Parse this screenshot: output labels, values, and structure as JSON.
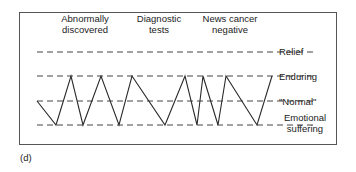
{
  "diagram": {
    "panel_label": "(d)",
    "events": [
      {
        "label_line1": "Abnormally",
        "label_line2": "discovered"
      },
      {
        "label_line1": "Diagnostic",
        "label_line2": "tests"
      },
      {
        "label_line1": "News cancer",
        "label_line2": "negative"
      }
    ],
    "levels": [
      {
        "name": "relief",
        "label": "Relief",
        "y": 52
      },
      {
        "name": "enduring",
        "label": "Enduring",
        "y": 76
      },
      {
        "name": "normal",
        "label": "\"Normal\"",
        "y": 101
      },
      {
        "name": "emotional-suffering",
        "label_line1": "Emotional",
        "label_line2": "suffering",
        "y": 125
      }
    ],
    "trajectory_points": [
      [
        37,
        101
      ],
      [
        56,
        125
      ],
      [
        71,
        76
      ],
      [
        83,
        125
      ],
      [
        101,
        76
      ],
      [
        119,
        125
      ],
      [
        132,
        76
      ],
      [
        165,
        125
      ],
      [
        185,
        76
      ],
      [
        197,
        125
      ],
      [
        203,
        76
      ],
      [
        218,
        125
      ],
      [
        226,
        76
      ],
      [
        257,
        125
      ],
      [
        272,
        76
      ]
    ],
    "colors": {
      "line": "#2a2a2a",
      "dash": "#444444",
      "frame": "#555555"
    }
  }
}
